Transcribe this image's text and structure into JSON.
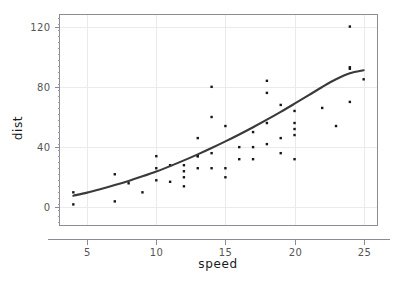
{
  "chart_data": {
    "type": "scatter",
    "title": "",
    "subtitle": "",
    "xlabel": "speed",
    "ylabel": "dist",
    "xlim": [
      3.0,
      26.0
    ],
    "ylim": [
      -12.0,
      128.0
    ],
    "xticks": [
      5,
      10,
      15,
      20,
      25
    ],
    "yticks": [
      0,
      40,
      80,
      120
    ],
    "xtick_labels": [
      "5",
      "10",
      "15",
      "20",
      "25"
    ],
    "ytick_labels": [
      "0",
      "40",
      "80",
      "120"
    ],
    "grid": true,
    "grid_axes": "both",
    "legend": false,
    "legend_position": "none",
    "marker": "square",
    "marker_size_px": 2.4,
    "point_color": "#161616",
    "curve_color": "#3a3a3a",
    "grid_color": "#e9e9ef",
    "frame_color": "#8c8c94",
    "background": "#ffffff",
    "annotations": [],
    "series": [
      {
        "name": "observations",
        "type": "scatter",
        "x": [
          4,
          4,
          7,
          7,
          8,
          9,
          10,
          10,
          10,
          11,
          11,
          12,
          12,
          12,
          12,
          13,
          13,
          13,
          13,
          14,
          14,
          14,
          14,
          15,
          15,
          15,
          16,
          16,
          17,
          17,
          17,
          18,
          18,
          18,
          18,
          19,
          19,
          19,
          20,
          20,
          20,
          20,
          20,
          22,
          23,
          24,
          24,
          24,
          24,
          25
        ],
        "y": [
          2,
          10,
          4,
          22,
          16,
          10,
          18,
          26,
          34,
          17,
          28,
          14,
          20,
          24,
          28,
          26,
          34,
          34,
          46,
          26,
          36,
          60,
          80,
          20,
          26,
          54,
          32,
          40,
          32,
          40,
          50,
          42,
          56,
          76,
          84,
          36,
          46,
          68,
          32,
          48,
          52,
          56,
          64,
          66,
          54,
          70,
          92,
          93,
          120,
          85
        ]
      },
      {
        "name": "fitted-curve",
        "type": "line",
        "description": "smooth fitted regression curve through the scatter",
        "x": [
          4.0,
          5.0,
          6.0,
          7.0,
          8.0,
          9.0,
          10.0,
          11.0,
          12.0,
          13.0,
          14.0,
          15.0,
          16.0,
          17.0,
          18.0,
          19.0,
          20.0,
          21.0,
          22.0,
          23.0,
          24.0,
          25.0
        ],
        "y": [
          7.8,
          9.8,
          12.2,
          14.8,
          17.6,
          20.6,
          23.8,
          27.4,
          31.2,
          35.2,
          39.4,
          43.8,
          48.4,
          53.2,
          58.2,
          63.4,
          68.8,
          74.3,
          79.9,
          85.0,
          89.0,
          91.0
        ]
      }
    ]
  }
}
